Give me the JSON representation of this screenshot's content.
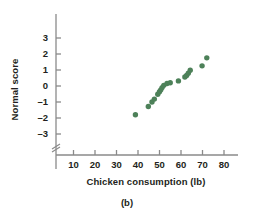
{
  "figure": {
    "caption": "(b)",
    "point_color": "#4d8159",
    "axis_color": "#8a8a8a",
    "text_color": "#231f20"
  },
  "chart_data": {
    "type": "scatter",
    "title": "",
    "xlabel": "Chicken consumption (lb)",
    "ylabel": "Normal score",
    "xlim": [
      0,
      85
    ],
    "ylim": [
      -3.6,
      3.4
    ],
    "xticks": [
      10,
      20,
      30,
      40,
      50,
      60,
      70,
      80
    ],
    "xticklabels": [
      "10",
      "20",
      "30",
      "40",
      "50",
      "60",
      "70",
      "80"
    ],
    "yticks": [
      -3,
      -2,
      -1,
      0,
      1,
      2,
      3
    ],
    "yticklabels": [
      "-3",
      "-2",
      "-1",
      "0",
      "1",
      "2",
      "3"
    ],
    "grid": false,
    "legend": null,
    "y_axis_break": true,
    "series": [
      {
        "name": "Chicken consumption normal probability plot",
        "marker": "circle",
        "color": "#4d8159",
        "points": [
          {
            "x": 38.8,
            "y": -1.8
          },
          {
            "x": 44.8,
            "y": -1.28
          },
          {
            "x": 46.5,
            "y": -1.0
          },
          {
            "x": 47.6,
            "y": -0.82
          },
          {
            "x": 49.2,
            "y": -0.52
          },
          {
            "x": 50.0,
            "y": -0.36
          },
          {
            "x": 50.6,
            "y": -0.24
          },
          {
            "x": 51.2,
            "y": -0.1
          },
          {
            "x": 52.0,
            "y": 0.04
          },
          {
            "x": 53.5,
            "y": 0.16
          },
          {
            "x": 55.0,
            "y": 0.2
          },
          {
            "x": 58.8,
            "y": 0.32
          },
          {
            "x": 61.8,
            "y": 0.56
          },
          {
            "x": 62.6,
            "y": 0.66
          },
          {
            "x": 63.4,
            "y": 0.8
          },
          {
            "x": 64.3,
            "y": 0.98
          },
          {
            "x": 69.8,
            "y": 1.26
          },
          {
            "x": 72.0,
            "y": 1.76
          }
        ]
      }
    ]
  }
}
